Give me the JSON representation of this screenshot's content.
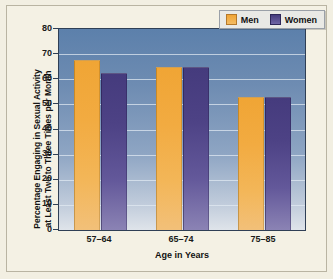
{
  "chart_data": {
    "type": "bar",
    "title": "",
    "xlabel": "Age in Years",
    "ylabel": "Percentage Engaging in Sexual Activity at Least Two to Three Times per Month",
    "categories": [
      "57–64",
      "65–74",
      "75–85"
    ],
    "series": [
      {
        "name": "Men",
        "values": [
          67.5,
          65,
          53
        ],
        "color": "#f0a535"
      },
      {
        "name": "Women",
        "values": [
          62.5,
          65,
          53
        ],
        "color": "#453b7d"
      }
    ],
    "ylim": [
      0,
      80
    ],
    "yticks": [
      0,
      10,
      20,
      30,
      40,
      50,
      60,
      70,
      80
    ],
    "ytick_labels": [
      "0",
      "10",
      "20",
      "30",
      "40",
      "50",
      "60",
      "70",
      "80"
    ],
    "grid": true,
    "grid_axis": "y",
    "legend_position": "top-right",
    "plot_background": "#5c80ab",
    "figure_background": "#f4f1e4"
  },
  "ylabel_lines": [
    "Percentage Engaging in Sexual Activity",
    "at Least Two to Three Times per Month"
  ],
  "legend": {
    "entries": [
      {
        "label": "Men"
      },
      {
        "label": "Women"
      }
    ]
  }
}
